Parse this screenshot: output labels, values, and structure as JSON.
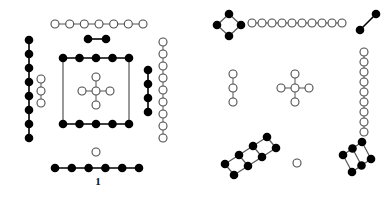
{
  "figure": {
    "background_color": "#ffffff",
    "filled_node_color": "#000000",
    "open_node_color": "#ffffff",
    "node_stroke_color": "#4d4d4d",
    "edge_color": "#555555",
    "panels": [
      {
        "id": "panel-1",
        "label": "1",
        "components": [
          {
            "name": "top-open-chain",
            "node_type": "open",
            "node_count": 7,
            "shape": "horizontal-chain"
          },
          {
            "name": "top-filled-pair",
            "node_type": "filled",
            "node_count": 2,
            "shape": "horizontal-chain"
          },
          {
            "name": "left-filled-column",
            "node_type": "filled",
            "node_count": 8,
            "shape": "vertical-chain"
          },
          {
            "name": "left-inner-open-column",
            "node_type": "open",
            "node_count": 3,
            "shape": "vertical-chain"
          },
          {
            "name": "central-filled-square",
            "node_type": "filled",
            "node_count": 10,
            "shape": "rectangle-ladder",
            "rows": 2,
            "per_row": 5
          },
          {
            "name": "central-open-cross",
            "node_type": "open",
            "node_count": 5,
            "shape": "cross"
          },
          {
            "name": "right-filled-column",
            "node_type": "filled",
            "node_count": 4,
            "shape": "vertical-chain"
          },
          {
            "name": "right-open-column",
            "node_type": "open",
            "node_count": 9,
            "shape": "vertical-chain"
          },
          {
            "name": "bottom-lone-open-node",
            "node_type": "open",
            "node_count": 1,
            "shape": "isolated-vertex"
          },
          {
            "name": "bottom-filled-chain",
            "node_type": "filled",
            "node_count": 6,
            "shape": "horizontal-chain"
          }
        ]
      },
      {
        "id": "panel-2",
        "label": "2",
        "components": [
          {
            "name": "top-left-filled-diamond",
            "node_type": "filled",
            "node_count": 4,
            "shape": "diamond-cycle"
          },
          {
            "name": "top-open-chain",
            "node_type": "open",
            "node_count": 10,
            "shape": "horizontal-chain"
          },
          {
            "name": "top-right-filled-pair",
            "node_type": "filled",
            "node_count": 2,
            "shape": "diagonal-chain"
          },
          {
            "name": "left-open-column",
            "node_type": "open",
            "node_count": 3,
            "shape": "vertical-chain"
          },
          {
            "name": "central-open-cross",
            "node_type": "open",
            "node_count": 5,
            "shape": "cross"
          },
          {
            "name": "right-open-column",
            "node_type": "open",
            "node_count": 9,
            "shape": "vertical-chain"
          },
          {
            "name": "bottom-left-filled-ladder",
            "node_type": "filled",
            "node_count": 8,
            "shape": "tilted-ladder",
            "rows": 2,
            "per_row": 4
          },
          {
            "name": "bottom-centre-lone-open-node",
            "node_type": "open",
            "node_count": 1,
            "shape": "isolated-vertex"
          },
          {
            "name": "bottom-right-filled-ladder",
            "node_type": "filled",
            "node_count": 6,
            "shape": "tilted-ladder",
            "rows": 2,
            "per_row": 3
          }
        ]
      }
    ]
  }
}
